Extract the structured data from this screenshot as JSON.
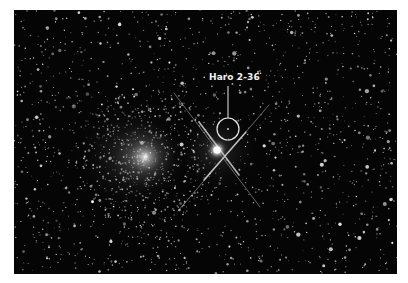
{
  "image": {
    "description": "Star field with a diffuse globular cluster and a bright foreground star with diffraction spikes; one object circled and labeled",
    "background_color": "#050505",
    "annotation": {
      "label": "Haro 2-36",
      "label_color": "#f2f2f2"
    }
  }
}
